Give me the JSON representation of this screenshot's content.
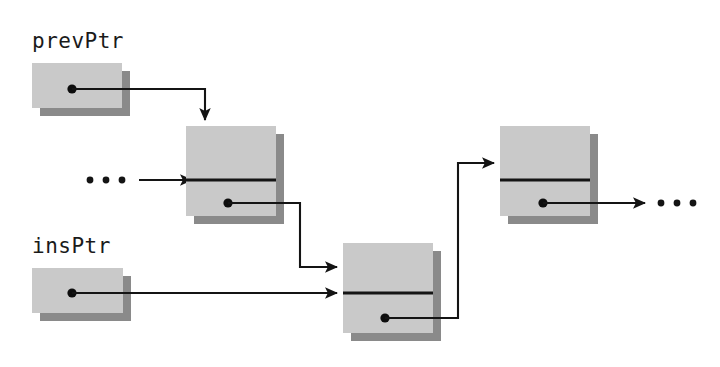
{
  "figure": {
    "background_color": "#ffffff",
    "box_fill_color": "#c9c9c9",
    "box_shadow_color": "#8a8a8a",
    "line_color": "#141414"
  },
  "labels": {
    "prev_pointer": "prevPtr",
    "ins_pointer": "insPtr"
  },
  "ellipsis": {
    "left": "• • •",
    "right": "• • •"
  },
  "pointer_boxes": [
    {
      "id": "prevPtr",
      "label": "prevPtr",
      "x": 32,
      "y": 63,
      "w": 90,
      "h": 45,
      "dot_x": 72,
      "dot_y": 89,
      "target": "node-2 top cell"
    },
    {
      "id": "insPtr",
      "label": "insPtr",
      "x": 32,
      "y": 268,
      "w": 91,
      "h": 45,
      "dot_x": 72,
      "dot_y": 293,
      "target": "node-3 divider"
    }
  ],
  "nodes": [
    {
      "id": "node-2",
      "x": 186,
      "y": 126,
      "w": 90,
      "h": 90,
      "divider_y": 180,
      "dot_x": 228,
      "dot_y": 203,
      "incoming": [
        "left-ellipsis",
        "prevPtr"
      ],
      "outgoing": "node-3"
    },
    {
      "id": "node-3",
      "x": 343,
      "y": 243,
      "w": 90,
      "h": 90,
      "divider_y": 293,
      "dot_x": 385,
      "dot_y": 318,
      "incoming": [
        "node-2",
        "insPtr"
      ],
      "outgoing": "node-4"
    },
    {
      "id": "node-4",
      "x": 500,
      "y": 126,
      "w": 90,
      "h": 90,
      "divider_y": 180,
      "dot_x": 543,
      "dot_y": 203,
      "incoming": [
        "node-3"
      ],
      "outgoing": "right-ellipsis"
    }
  ],
  "connections": [
    {
      "id": "prevptr-to-node2",
      "from": "prevPtr dot",
      "to": "node-2 top cell",
      "shape": "right-then-down"
    },
    {
      "id": "ellipsis-to-node2",
      "from": "left ellipsis",
      "to": "node-2 divider",
      "shape": "straight"
    },
    {
      "id": "node2-to-node3",
      "from": "node-2 dot",
      "to": "node-3 top cell",
      "shape": "right-down-right"
    },
    {
      "id": "insptr-to-node3",
      "from": "insPtr dot",
      "to": "node-3 divider",
      "shape": "straight"
    },
    {
      "id": "node3-to-node4",
      "from": "node-3 dot",
      "to": "node-4 top cell",
      "shape": "right-up-right"
    },
    {
      "id": "node4-to-ellipsis",
      "from": "node-4 dot",
      "to": "right ellipsis",
      "shape": "straight"
    }
  ]
}
